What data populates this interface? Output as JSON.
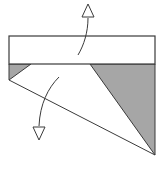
{
  "diagram": {
    "type": "origami-fold-step",
    "colors": {
      "background": "#ffffff",
      "line": "#3a3a3a",
      "shade": "#a6a6a6"
    },
    "elements": {
      "top_band": {
        "x": 9,
        "y": 36,
        "width": 146,
        "height": 28
      },
      "left_flap": {
        "points": "9,64 31,64 9,80"
      },
      "right_flap": {
        "points": "90,64 155,64 155,155"
      },
      "bottom_diagonal": {
        "x1": 9,
        "y1": 80,
        "x2": 155,
        "y2": 155
      },
      "arrows": [
        {
          "name": "fold-up-arrow",
          "direction": "up"
        },
        {
          "name": "fold-down-arrow",
          "direction": "down"
        }
      ]
    }
  }
}
